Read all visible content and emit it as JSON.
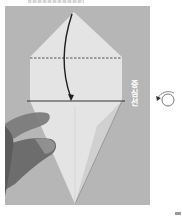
{
  "image": {
    "description": "Origami instruction photo: a kite-shaped paper fold on a grey background, with a dashed fold line, a solid crease line, a curved arrow folding the top point down, a hand holding the paper, and a turn-over symbol",
    "background_color": "#b8b8b8",
    "paper_color": "#e6e6e6",
    "paper_shade_color": "#d2d2d2"
  },
  "labels": {
    "vertical_text": "중심선",
    "vertical_text_note": "Tentative reading; the text is too small to confirm from the pixels",
    "top_text_note": "Clipped text at the top edge, illegible"
  },
  "diagram": {
    "fold_lines": [
      {
        "type": "dashed",
        "role": "valley-fold-line"
      },
      {
        "type": "solid",
        "role": "crease-line"
      }
    ],
    "arrow": {
      "direction": "down",
      "meaning": "fold the top point down to the crease line"
    },
    "symbol": {
      "name": "turn-over-icon",
      "meaning": "turn the model over"
    }
  }
}
